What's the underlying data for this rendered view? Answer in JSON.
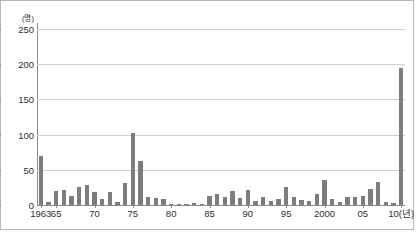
{
  "chart_data": {
    "type": "bar",
    "title": "",
    "subtitle": "",
    "xlabel": "",
    "ylabel": "",
    "y_unit_label": "(명)",
    "x_unit_label": "(년)",
    "ylim": [
      0,
      250
    ],
    "y_ticks": [
      0,
      50,
      100,
      150,
      200,
      250
    ],
    "y_tick_labels": [
      "0",
      "50",
      "100",
      "150",
      "200",
      "250"
    ],
    "grid": true,
    "legend": "none",
    "bar_color": "#7d7d7d",
    "gridline_color": "#cfcfcf",
    "axis_color": "#8a8a8a",
    "border_color": "#b8b8b8",
    "background_color": "#ffffff",
    "x_tick_labels": [
      {
        "year": 1963,
        "label": "1963"
      },
      {
        "year": 1965,
        "label": "65"
      },
      {
        "year": 1970,
        "label": "70"
      },
      {
        "year": 1975,
        "label": "75"
      },
      {
        "year": 1980,
        "label": "80"
      },
      {
        "year": 1985,
        "label": "85"
      },
      {
        "year": 1990,
        "label": "90"
      },
      {
        "year": 1995,
        "label": "95"
      },
      {
        "year": 2000,
        "label": "2000"
      },
      {
        "year": 2005,
        "label": "05"
      },
      {
        "year": 2010,
        "label": "10(년)"
      }
    ],
    "categories": [
      1963,
      1964,
      1965,
      1966,
      1967,
      1968,
      1969,
      1970,
      1971,
      1972,
      1973,
      1974,
      1975,
      1976,
      1977,
      1978,
      1979,
      1980,
      1981,
      1982,
      1983,
      1984,
      1985,
      1986,
      1987,
      1988,
      1989,
      1990,
      1991,
      1992,
      1993,
      1994,
      1995,
      1996,
      1997,
      1998,
      1999,
      2000,
      2001,
      2002,
      2003,
      2004,
      2005,
      2006,
      2007,
      2008,
      2009,
      2010
    ],
    "values": [
      70,
      4,
      20,
      22,
      13,
      26,
      28,
      18,
      8,
      19,
      4,
      31,
      102,
      62,
      11,
      10,
      9,
      2,
      1,
      1,
      3,
      2,
      13,
      15,
      12,
      20,
      10,
      21,
      6,
      12,
      6,
      8,
      26,
      11,
      7,
      5,
      15,
      35,
      9,
      4,
      12,
      11,
      13,
      23,
      33,
      4,
      3,
      194
    ]
  }
}
